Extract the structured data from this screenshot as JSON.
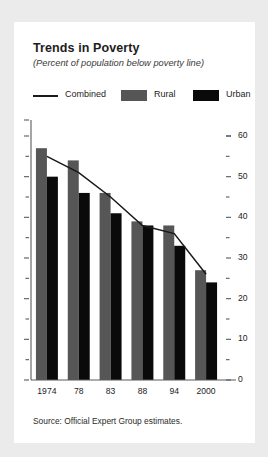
{
  "card": {
    "title": "Trends in Poverty",
    "subtitle": "(Percent of population below poverty line)",
    "source": "Source: Official Expert Group estimates."
  },
  "legend": [
    {
      "label": "Combined",
      "marker": "line",
      "color": "#1a1a1a"
    },
    {
      "label": "Rural",
      "marker": "swatch",
      "color": "#565656"
    },
    {
      "label": "Urban",
      "marker": "swatch",
      "color": "#0a0a0a"
    }
  ],
  "colors": {
    "background": "#ebebeb",
    "card": "#ffffff",
    "rural": "#565656",
    "urban": "#0a0a0a",
    "combined": "#1a1a1a",
    "axis": "#5a5a5a",
    "text": "#1d1d1d"
  },
  "chart_data": {
    "type": "bar",
    "title": "Trends in Poverty",
    "subtitle": "(Percent of population below poverty line)",
    "xlabel": "",
    "ylabel": "",
    "categories": [
      "1974",
      "78",
      "83",
      "88",
      "94",
      "2000"
    ],
    "series": [
      {
        "name": "Rural",
        "type": "bar",
        "color": "#565656",
        "values": [
          57,
          54,
          46,
          39,
          38,
          27
        ]
      },
      {
        "name": "Urban",
        "type": "bar",
        "color": "#0a0a0a",
        "values": [
          50,
          46,
          41,
          38,
          33,
          24
        ]
      },
      {
        "name": "Combined",
        "type": "line",
        "color": "#1a1a1a",
        "values": [
          55,
          51,
          45,
          38,
          36,
          26
        ]
      }
    ],
    "ylim": [
      0,
      60
    ],
    "yticks": [
      0,
      10,
      20,
      30,
      40,
      50,
      60
    ],
    "ytick_labels": [
      "0",
      "10",
      "20",
      "30",
      "40",
      "50",
      "60"
    ],
    "yminor_ticks": [
      5,
      15,
      25,
      35,
      45,
      55
    ],
    "y_axis_position": "right",
    "left_axis_ticks": true,
    "grid": false,
    "legend_position": "top",
    "source": "Source: Official Expert Group estimates."
  }
}
